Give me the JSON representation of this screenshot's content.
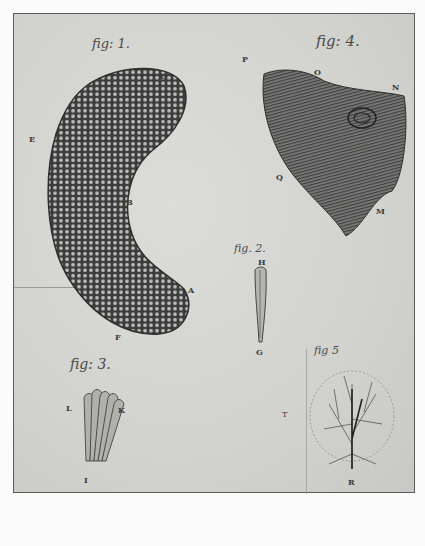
{
  "plate": {
    "figures": [
      {
        "caption": "fig: 1.",
        "labels": [
          "A",
          "B",
          "C",
          "D",
          "E",
          "F"
        ]
      },
      {
        "caption": "fig. 2.",
        "labels": [
          "H",
          "G"
        ]
      },
      {
        "caption": "fig: 3.",
        "labels": [
          "L",
          "K",
          "I"
        ]
      },
      {
        "caption": "fig: 4.",
        "labels": [
          "P",
          "O",
          "N",
          "Q",
          "M"
        ]
      },
      {
        "caption": "fig 5",
        "labels": [
          "T",
          "R"
        ]
      }
    ]
  }
}
